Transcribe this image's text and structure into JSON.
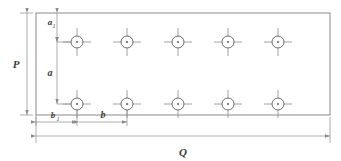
{
  "drawing": {
    "title": "Hole pattern layout dimension drawing",
    "type": "engineering-dimension-drawing",
    "colors": {
      "line": "#8a8a8a",
      "outline": "#8a8a8a",
      "hole": "#6d6d6d",
      "text": "#3a3a3a",
      "background": "#ffffff"
    },
    "labels": {
      "plate_height": "P",
      "plate_width": "Q",
      "edge_distance_vertical": "a",
      "edge_distance_vertical_sub": "1",
      "row_spacing": "a",
      "edge_distance_horizontal": "b",
      "edge_distance_horizontal_sub": "1",
      "hole_spacing": "b"
    },
    "plate": {
      "x": 36,
      "y": 13,
      "width": 294,
      "height": 102
    },
    "holes": {
      "radius": 6,
      "center_dot_radius": 0.9,
      "crosshair_length": 14,
      "columns_x": [
        77,
        127,
        178,
        228,
        278
      ],
      "rows_y": [
        42,
        104
      ],
      "count_per_row": 5,
      "row_count": 2,
      "total": 10
    },
    "dimensions": [
      {
        "name": "P",
        "orientation": "vertical",
        "label": "P",
        "from": 13,
        "to": 115,
        "axis_pos": 27
      },
      {
        "name": "Q",
        "orientation": "horizontal",
        "label": "Q",
        "from": 36,
        "to": 330,
        "axis_pos": 136
      },
      {
        "name": "a1",
        "orientation": "vertical",
        "label": "a",
        "sub": "1",
        "from": 13,
        "to": 42,
        "axis_pos": 57
      },
      {
        "name": "a",
        "orientation": "vertical",
        "label": "a",
        "from": 42,
        "to": 104,
        "axis_pos": 57
      },
      {
        "name": "b1",
        "orientation": "horizontal",
        "label": "b",
        "sub": "1",
        "from": 36,
        "to": 77,
        "axis_pos": 122
      },
      {
        "name": "b",
        "orientation": "horizontal",
        "label": "b",
        "from": 77,
        "to": 127,
        "axis_pos": 122
      }
    ]
  }
}
